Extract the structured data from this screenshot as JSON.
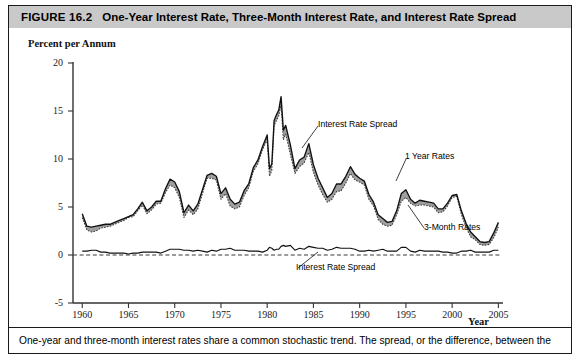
{
  "figure": {
    "number_label": "FIGURE 16.2",
    "title": "One-Year Interest Rate, Three-Month Interest Rate, and Interest Rate Spread",
    "caption": "One-year and three-month interest rates share a common stochastic trend. The spread, or the difference, between the",
    "header_bg": "#c9c9c9",
    "border_color": "#1a1a1a"
  },
  "annotations": {
    "spread_upper": "Interest Rate Spread",
    "one_year": "1 Year Rates",
    "three_month": "3-Month Rates",
    "spread_lower": "Interest Rate Spread"
  },
  "chart_data": {
    "type": "line",
    "title": "One-Year Interest Rate, Three-Month Interest Rate, and Interest Rate Spread",
    "xlabel": "Year",
    "ylabel": "Percent per Annum",
    "xlim": [
      1959.0,
      2005.5
    ],
    "ylim": [
      -5,
      20
    ],
    "xticks": [
      1960,
      1965,
      1970,
      1975,
      1980,
      1985,
      1990,
      1995,
      2000,
      2005
    ],
    "yticks": [
      20,
      15,
      10,
      5,
      0,
      -5
    ],
    "grid": false,
    "legend": "none",
    "zero_reference_line": {
      "value": 0,
      "style": "dashed"
    },
    "shaded_band": {
      "between": [
        "1 Year Rates",
        "3-Month Rates"
      ],
      "color": "#9a9a9a",
      "description": "gray fill showing the interest rate spread"
    },
    "colors": {
      "one_year_line": "#111111",
      "three_month_line": "#444444",
      "spread_line": "#111111",
      "band_fill": "#9a9a9a"
    },
    "x": [
      1960.0,
      1960.5,
      1961.0,
      1961.5,
      1962.0,
      1962.5,
      1963.0,
      1963.5,
      1964.0,
      1964.5,
      1965.0,
      1965.5,
      1966.0,
      1966.5,
      1967.0,
      1967.5,
      1968.0,
      1968.5,
      1969.0,
      1969.5,
      1970.0,
      1970.5,
      1971.0,
      1971.5,
      1972.0,
      1972.5,
      1973.0,
      1973.5,
      1974.0,
      1974.5,
      1975.0,
      1975.5,
      1976.0,
      1976.5,
      1977.0,
      1977.5,
      1978.0,
      1978.5,
      1979.0,
      1979.5,
      1980.0,
      1980.25,
      1980.5,
      1980.75,
      1981.0,
      1981.25,
      1981.5,
      1981.75,
      1982.0,
      1982.5,
      1983.0,
      1983.5,
      1984.0,
      1984.5,
      1985.0,
      1985.5,
      1986.0,
      1986.5,
      1987.0,
      1987.5,
      1988.0,
      1988.5,
      1989.0,
      1989.5,
      1990.0,
      1990.5,
      1991.0,
      1991.5,
      1992.0,
      1992.5,
      1993.0,
      1993.5,
      1994.0,
      1994.5,
      1995.0,
      1995.5,
      1996.0,
      1996.5,
      1997.0,
      1997.5,
      1998.0,
      1998.5,
      1999.0,
      1999.5,
      2000.0,
      2000.5,
      2001.0,
      2001.5,
      2002.0,
      2002.5,
      2003.0,
      2003.5,
      2004.0,
      2004.5,
      2005.0
    ],
    "series": [
      {
        "name": "1 Year Rates",
        "style": "solid",
        "values": [
          4.3,
          3.0,
          2.9,
          3.0,
          3.1,
          3.2,
          3.2,
          3.4,
          3.6,
          3.8,
          4.0,
          4.2,
          4.8,
          5.5,
          4.6,
          5.0,
          5.6,
          5.6,
          6.9,
          7.9,
          7.6,
          6.6,
          4.4,
          5.2,
          4.6,
          5.3,
          6.8,
          8.3,
          8.5,
          8.2,
          6.4,
          7.0,
          5.8,
          5.3,
          5.5,
          6.7,
          7.4,
          9.1,
          9.9,
          11.3,
          12.5,
          9.0,
          9.5,
          14.0,
          14.6,
          15.1,
          16.5,
          13.0,
          13.5,
          11.5,
          9.0,
          9.9,
          10.2,
          11.6,
          9.4,
          8.0,
          7.0,
          6.0,
          6.4,
          7.4,
          7.4,
          8.2,
          9.2,
          8.4,
          8.0,
          7.7,
          6.3,
          5.5,
          4.2,
          3.8,
          3.4,
          3.5,
          4.6,
          6.4,
          6.8,
          5.8,
          5.4,
          5.7,
          5.6,
          5.5,
          5.4,
          4.8,
          4.8,
          5.4,
          6.2,
          6.3,
          4.6,
          3.3,
          2.4,
          1.9,
          1.4,
          1.3,
          1.4,
          2.3,
          3.4
        ],
        "description": "one-year Treasury rate, solid black line"
      },
      {
        "name": "3-Month Rates",
        "style": "dotted",
        "values": [
          3.9,
          2.6,
          2.4,
          2.5,
          2.8,
          2.9,
          3.0,
          3.2,
          3.4,
          3.6,
          3.9,
          4.0,
          4.6,
          5.2,
          4.3,
          4.7,
          5.3,
          5.4,
          6.5,
          7.3,
          7.0,
          6.0,
          3.9,
          4.7,
          4.2,
          4.8,
          6.4,
          8.0,
          8.0,
          7.8,
          5.8,
          6.4,
          5.1,
          4.8,
          5.0,
          6.2,
          7.0,
          8.7,
          9.5,
          11.0,
          12.0,
          8.2,
          8.8,
          13.5,
          14.0,
          14.5,
          15.6,
          12.0,
          12.6,
          10.5,
          8.5,
          9.2,
          9.6,
          10.7,
          8.6,
          7.3,
          6.3,
          5.5,
          5.8,
          6.6,
          6.7,
          7.5,
          8.5,
          7.8,
          7.6,
          7.3,
          5.8,
          5.1,
          3.7,
          3.2,
          3.0,
          3.1,
          4.2,
          5.6,
          6.0,
          5.4,
          5.1,
          5.2,
          5.2,
          5.1,
          5.0,
          4.4,
          4.5,
          5.1,
          6.0,
          6.1,
          4.2,
          2.9,
          1.9,
          1.6,
          1.1,
          1.0,
          1.1,
          1.8,
          2.9
        ],
        "description": "three-month Treasury rate, dotted line (lies below the one-year rate)"
      },
      {
        "name": "Interest Rate Spread",
        "style": "solid",
        "values": [
          0.4,
          0.4,
          0.5,
          0.5,
          0.3,
          0.3,
          0.2,
          0.2,
          0.2,
          0.2,
          0.1,
          0.2,
          0.2,
          0.3,
          0.3,
          0.3,
          0.3,
          0.2,
          0.4,
          0.6,
          0.6,
          0.6,
          0.5,
          0.5,
          0.4,
          0.5,
          0.4,
          0.3,
          0.5,
          0.4,
          0.6,
          0.6,
          0.7,
          0.5,
          0.5,
          0.5,
          0.4,
          0.4,
          0.4,
          0.3,
          0.5,
          0.8,
          0.7,
          0.5,
          0.6,
          0.6,
          0.9,
          1.0,
          0.9,
          1.0,
          0.5,
          0.7,
          0.6,
          0.9,
          0.8,
          0.7,
          0.7,
          0.5,
          0.6,
          0.8,
          0.7,
          0.7,
          0.7,
          0.6,
          0.4,
          0.4,
          0.5,
          0.4,
          0.5,
          0.6,
          0.4,
          0.4,
          0.4,
          0.8,
          0.8,
          0.4,
          0.3,
          0.5,
          0.4,
          0.4,
          0.4,
          0.4,
          0.3,
          0.3,
          0.2,
          0.2,
          0.4,
          0.4,
          0.5,
          0.3,
          0.3,
          0.3,
          0.3,
          0.5,
          0.5
        ],
        "description": "difference between the one-year and three-month rates, plotted near zero"
      }
    ]
  }
}
